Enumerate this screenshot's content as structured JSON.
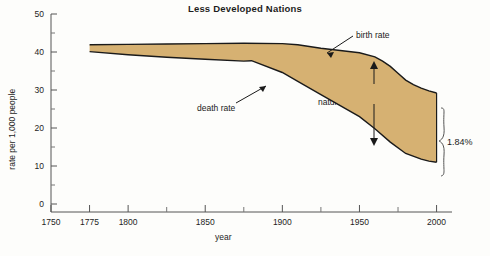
{
  "chart_data": {
    "type": "area",
    "title": "Less Developed Nations",
    "xlabel": "year",
    "ylabel": "rate per 1,000 people",
    "xlim": [
      1750,
      2010
    ],
    "ylim": [
      0,
      50
    ],
    "xticks": [
      1750,
      1775,
      1800,
      1850,
      1900,
      1950,
      2000
    ],
    "xtick_labels": [
      "1750",
      "1775",
      "1800",
      "1850",
      "1900",
      "1950",
      "2000"
    ],
    "xminor_ticks": [
      1825,
      1875,
      1925,
      1975
    ],
    "yticks": [
      0,
      10,
      20,
      30,
      40,
      50
    ],
    "ytick_labels": [
      "0",
      "10",
      "20",
      "30",
      "40",
      "50"
    ],
    "yminor_ticks": [
      5,
      15,
      25,
      35,
      45
    ],
    "grid": false,
    "legend": "none",
    "fill_color": "#d6b172",
    "line_color": "#1a1a1a",
    "series": [
      {
        "name": "birth rate",
        "x": [
          1775,
          1800,
          1825,
          1850,
          1875,
          1900,
          1910,
          1925,
          1950,
          1960,
          1965,
          1970,
          1975,
          1980,
          1985,
          1990,
          1995,
          2000
        ],
        "values": [
          41.9,
          42.0,
          42.1,
          42.2,
          42.3,
          42.2,
          41.9,
          41.0,
          39.8,
          38.7,
          37.6,
          36.2,
          34.4,
          32.6,
          31.4,
          30.5,
          29.8,
          29.2
        ]
      },
      {
        "name": "death rate",
        "x": [
          1775,
          1800,
          1825,
          1850,
          1875,
          1880,
          1900,
          1910,
          1925,
          1950,
          1960,
          1970,
          1980,
          1990,
          1995,
          2000
        ],
        "values": [
          40.1,
          39.3,
          38.6,
          38.1,
          37.6,
          37.7,
          34.6,
          32.3,
          28.8,
          23.0,
          19.8,
          16.3,
          13.3,
          11.8,
          11.3,
          11.0
        ]
      }
    ],
    "annotations": [
      {
        "name": "birth-rate",
        "text": "birth rate"
      },
      {
        "name": "death-rate",
        "text": "death rate"
      },
      {
        "name": "rate-of-natural-increase-line1",
        "text": "rate of"
      },
      {
        "name": "rate-of-natural-increase-line2",
        "text": "natural increase"
      },
      {
        "name": "brace-value",
        "text": "1.84%"
      }
    ]
  }
}
